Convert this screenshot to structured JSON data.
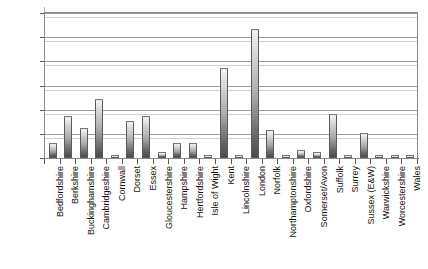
{
  "chart_data": {
    "type": "bar",
    "title": "",
    "subtitle": "",
    "xlabel": "",
    "ylabel": "",
    "ylim": [
      0,
      60
    ],
    "ytick_values": [
      0,
      10,
      20,
      30,
      40,
      50,
      60
    ],
    "ytick_labels": [
      "0",
      "10",
      "20",
      "30",
      "40",
      "50",
      "60"
    ],
    "grid": true,
    "legend": false,
    "legend_position": "none",
    "categories": [
      "Bedfordshire",
      "Berkshire",
      "Buckinghamshire",
      "Cambridgeshire",
      "Cornwall",
      "Dorset",
      "Essex",
      "Gloucestershire",
      "Hampshire",
      "Hertfordshire",
      "Isle of Wight",
      "Kent",
      "Lincolnshire",
      "London",
      "Norfolk",
      "Northamptonshire",
      "Oxfordshire",
      "Somerset/Avon",
      "Suffolk",
      "Surrey",
      "Sussex (E&W)",
      "Warwickshire",
      "Worcestershire",
      "Wales"
    ],
    "values": [
      6,
      17,
      12,
      24,
      0.5,
      15,
      17,
      2,
      6,
      6,
      1,
      37,
      1,
      53,
      11,
      1,
      3,
      2,
      18,
      1,
      10,
      1,
      1,
      1
    ],
    "series": [
      {
        "name": "Count",
        "values": [
          6,
          17,
          12,
          24,
          0.5,
          15,
          17,
          2,
          6,
          6,
          1,
          37,
          1,
          53,
          11,
          1,
          3,
          2,
          18,
          1,
          10,
          1,
          1,
          1
        ]
      }
    ],
    "colors": {
      "bar_top": "#f2f2f2",
      "bar_bottom": "#4a4a4a",
      "bar_outline": "#5b5b5b",
      "gridline": "#9a9a9a",
      "axis": "#555555",
      "plot_background": "#ffffff",
      "text": "#111111"
    }
  }
}
